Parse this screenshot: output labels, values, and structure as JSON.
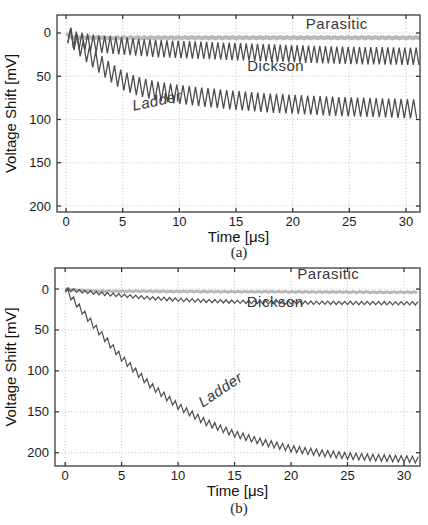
{
  "chart_data": [
    {
      "type": "line",
      "caption": "(a)",
      "xlabel": "Time [μs]",
      "ylabel": "Voltage Shift [mV]",
      "xticks": [
        0,
        5,
        10,
        15,
        20,
        25,
        30
      ],
      "yticks": [
        0,
        50,
        100,
        150,
        200
      ],
      "xlim": [
        -0.8,
        31.24
      ],
      "ylim": [
        -20.8,
        206.9
      ],
      "y_axis_reversed": true,
      "grid": true,
      "legend_position": "inline-labels",
      "colors": {
        "frame": "#2b2b2b",
        "grid": "#c3c3c3",
        "tick_label": "#1a1a1a",
        "series_label": "#383838",
        "parasitic": "#b9b9b9",
        "dark_curve": "#4d4d4d"
      },
      "series": [
        {
          "name": "parasitic",
          "label": "Parasitic",
          "color": "#b9b9b9",
          "width": 4,
          "ripple_amp": 0.8,
          "ripple_period": 0.6,
          "label_pos": [
            23.9,
            -5
          ],
          "label_rotation": 0,
          "label_italic": false,
          "points": [
            [
              0,
              0
            ],
            [
              0.4,
              5
            ],
            [
              2,
              5.5
            ],
            [
              31.2,
              5.5
            ]
          ]
        },
        {
          "name": "dickson",
          "label": "Dickson",
          "color": "#4d4d4d",
          "width": 1.3,
          "ripple_amp": 10,
          "ripple_period": 0.5,
          "label_pos": [
            18.5,
            44
          ],
          "label_rotation": 0,
          "label_italic": false,
          "points": [
            [
              0.15,
              1
            ],
            [
              0.7,
              8
            ],
            [
              2,
              11
            ],
            [
              3,
              13
            ],
            [
              5,
              15
            ],
            [
              8,
              18
            ],
            [
              12,
              20
            ],
            [
              16,
              22
            ],
            [
              20,
              24
            ],
            [
              25,
              26
            ],
            [
              31.2,
              27
            ]
          ]
        },
        {
          "name": "ladder",
          "label": "Ladder",
          "color": "#4d4d4d",
          "width": 1.3,
          "ripple_amp": 11,
          "ripple_period": 0.55,
          "label_pos": [
            8.1,
            84
          ],
          "label_rotation": -12,
          "label_italic": true,
          "points": [
            [
              0.15,
              1
            ],
            [
              1,
              13
            ],
            [
              2,
              25
            ],
            [
              3,
              36
            ],
            [
              4,
              46
            ],
            [
              5,
              55
            ],
            [
              6,
              60
            ],
            [
              7,
              64
            ],
            [
              8,
              67
            ],
            [
              10,
              71
            ],
            [
              12,
              74
            ],
            [
              15,
              78
            ],
            [
              18,
              81
            ],
            [
              21,
              83
            ],
            [
              24,
              85
            ],
            [
              27,
              86
            ],
            [
              31.2,
              88
            ]
          ]
        }
      ]
    },
    {
      "type": "line",
      "caption": "(b)",
      "xlabel": "Time [μs]",
      "ylabel": "Voltage Shift [mV]",
      "xticks": [
        0,
        5,
        10,
        15,
        20,
        25,
        30
      ],
      "yticks": [
        0,
        50,
        100,
        150,
        200
      ],
      "xlim": [
        -0.9,
        31.42
      ],
      "ylim": [
        -25.7,
        216.2
      ],
      "y_axis_reversed": true,
      "grid": true,
      "legend_position": "inline-labels",
      "colors": {
        "frame": "#2b2b2b",
        "grid": "#c3c3c3",
        "tick_label": "#1a1a1a",
        "series_label": "#383838",
        "parasitic": "#b9b9b9",
        "dark_curve": "#4d4d4d"
      },
      "series": [
        {
          "name": "parasitic",
          "label": "Parasitic",
          "color": "#b9b9b9",
          "width": 3,
          "ripple_amp": 0.6,
          "ripple_period": 0.6,
          "label_pos": [
            23.3,
            -12
          ],
          "label_rotation": 0,
          "label_italic": false,
          "points": [
            [
              0,
              0
            ],
            [
              1,
              1.5
            ],
            [
              3,
              2.5
            ],
            [
              10,
              3
            ],
            [
              31.4,
              4
            ]
          ]
        },
        {
          "name": "dickson",
          "label": "Dickson",
          "color": "#4d4d4d",
          "width": 1.2,
          "ripple_amp": 2,
          "ripple_period": 0.5,
          "label_pos": [
            18.6,
            22
          ],
          "label_rotation": 0,
          "label_italic": false,
          "points": [
            [
              0,
              0
            ],
            [
              1,
              2
            ],
            [
              2.5,
              4.5
            ],
            [
              5,
              8
            ],
            [
              7.5,
              11
            ],
            [
              10,
              13
            ],
            [
              12.5,
              14.5
            ],
            [
              15,
              15.5
            ],
            [
              20,
              16.5
            ],
            [
              25,
              17
            ],
            [
              31.4,
              17.5
            ]
          ]
        },
        {
          "name": "ladder",
          "label": "Ladder",
          "color": "#4d4d4d",
          "width": 1.2,
          "ripple_amp": 4,
          "ripple_period": 0.5,
          "label_pos": [
            14.0,
            128
          ],
          "label_rotation": -34,
          "label_italic": true,
          "points": [
            [
              0,
              0
            ],
            [
              1,
              18
            ],
            [
              2.5,
              44
            ],
            [
              5,
              84
            ],
            [
              7.5,
              117
            ],
            [
              10,
              143
            ],
            [
              12.5,
              163
            ],
            [
              15,
              177
            ],
            [
              17.5,
              187
            ],
            [
              20,
              195
            ],
            [
              22.5,
              200
            ],
            [
              25,
              204
            ],
            [
              27.5,
              206
            ],
            [
              30,
              207.5
            ],
            [
              31.4,
              209
            ]
          ]
        }
      ]
    }
  ]
}
